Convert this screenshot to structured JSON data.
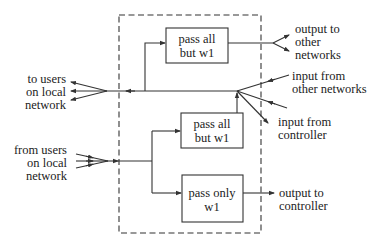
{
  "diagram": {
    "boxes": {
      "top_filter": [
        "pass all",
        "but w1"
      ],
      "middle_filter": [
        "pass all",
        "but w1"
      ],
      "bottom_filter": [
        "pass only",
        "w1"
      ]
    },
    "labels": {
      "to_users": [
        "to users",
        "on local",
        "network"
      ],
      "from_users": [
        "from users",
        "on local",
        "network"
      ],
      "output_other_networks": [
        "output to",
        "other",
        "networks"
      ],
      "input_other_networks": [
        "input from",
        "other networks"
      ],
      "input_controller": [
        "input from",
        "controller"
      ],
      "output_controller": [
        "output to",
        "controller"
      ]
    }
  }
}
